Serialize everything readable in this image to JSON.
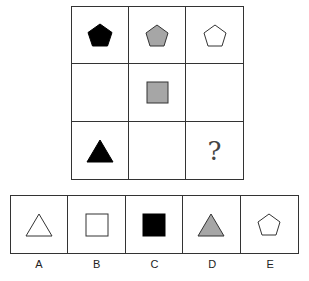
{
  "puzzle": {
    "grid": [
      [
        {
          "shape": "pentagon",
          "fill": "#000000"
        },
        {
          "shape": "pentagon",
          "fill": "#a6a6a6"
        },
        {
          "shape": "pentagon",
          "fill": "#ffffff"
        }
      ],
      [
        {
          "shape": "empty"
        },
        {
          "shape": "square",
          "fill": "#a6a6a6"
        },
        {
          "shape": "empty"
        }
      ],
      [
        {
          "shape": "triangle",
          "fill": "#000000"
        },
        {
          "shape": "empty"
        },
        {
          "shape": "question",
          "text": "?"
        }
      ]
    ],
    "question_mark": "?"
  },
  "options": [
    {
      "label": "A",
      "shape": "triangle",
      "fill": "#ffffff"
    },
    {
      "label": "B",
      "shape": "square",
      "fill": "#ffffff"
    },
    {
      "label": "C",
      "shape": "square",
      "fill": "#000000"
    },
    {
      "label": "D",
      "shape": "triangle",
      "fill": "#a6a6a6"
    },
    {
      "label": "E",
      "shape": "pentagon",
      "fill": "#ffffff"
    }
  ]
}
